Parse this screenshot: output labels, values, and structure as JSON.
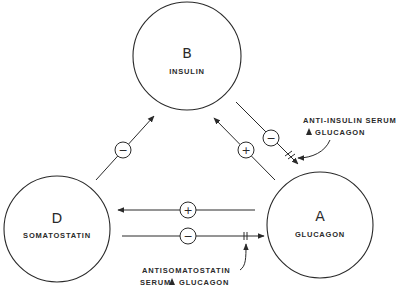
{
  "nodes": {
    "B": {
      "letter": "B",
      "name": "INSULIN"
    },
    "D": {
      "letter": "D",
      "name": "SOMATOSTATIN"
    },
    "A": {
      "letter": "A",
      "name": "GLUCAGON"
    }
  },
  "edges": [
    {
      "from": "D",
      "to": "B",
      "sign": "−"
    },
    {
      "from": "A",
      "to": "B",
      "sign": "+"
    },
    {
      "from": "B",
      "to": "A",
      "sign": "−",
      "blocked": true
    },
    {
      "from": "A",
      "to": "D",
      "sign": "+"
    },
    {
      "from": "D",
      "to": "A",
      "sign": "−",
      "blocked": true
    }
  ],
  "annotations": {
    "anti_insulin": {
      "line1": "ANTI-INSULIN SERUM",
      "line2": "GLUCAGON"
    },
    "antisomatostatin": {
      "line1": "ANTISOMATOSTATIN",
      "line2a": "SERUM",
      "line2b": "GLUCAGON"
    }
  },
  "colors": {
    "ink": "#2a2a2a",
    "background": "#ffffff"
  }
}
